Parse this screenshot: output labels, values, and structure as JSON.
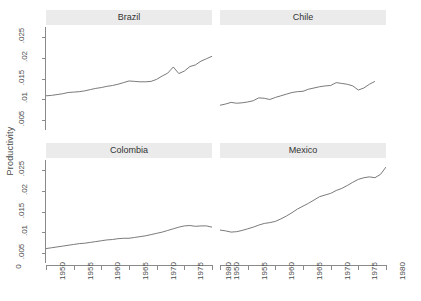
{
  "chart_data": {
    "type": "line",
    "title": "",
    "xlabel": "",
    "ylabel": "Productivity",
    "xlim": [
      1950,
      1980
    ],
    "ylim": [
      0.0025,
      0.0275
    ],
    "grid": false,
    "legend": "none",
    "layout": "2x2 trellis panels, shared axes",
    "yticks": [
      0.005,
      0.01,
      0.015,
      0.02,
      0.025
    ],
    "ytick_labels": [
      ".005",
      ".01",
      ".015",
      ".02",
      ".025"
    ],
    "xticks": [
      1950,
      1955,
      1960,
      1965,
      1970,
      1975,
      1980
    ],
    "xtick_labels": [
      "1950",
      "1955",
      "1960",
      "1965",
      "1970",
      "1975",
      "1980"
    ],
    "zero_tick_label": "0",
    "line_color": "#6b6b6b",
    "strip_color": "#ebebeb",
    "panels": [
      {
        "name": "Brazil",
        "row": 0,
        "col": 0,
        "x": [
          1950,
          1951,
          1952,
          1953,
          1954,
          1955,
          1956,
          1957,
          1958,
          1959,
          1960,
          1961,
          1962,
          1963,
          1964,
          1965,
          1966,
          1967,
          1968,
          1969,
          1970,
          1971,
          1972,
          1973,
          1974,
          1975,
          1976,
          1977,
          1978,
          1979,
          1980
        ],
        "y": [
          0.0108,
          0.0109,
          0.0111,
          0.0113,
          0.0116,
          0.0117,
          0.0118,
          0.012,
          0.0123,
          0.0126,
          0.0128,
          0.0131,
          0.0133,
          0.0136,
          0.014,
          0.0144,
          0.0143,
          0.0142,
          0.0142,
          0.0143,
          0.0148,
          0.0156,
          0.0163,
          0.0178,
          0.0162,
          0.0168,
          0.0179,
          0.0183,
          0.0192,
          0.0198,
          0.0204
        ]
      },
      {
        "name": "Chile",
        "row": 0,
        "col": 1,
        "x": [
          1950,
          1951,
          1952,
          1953,
          1954,
          1955,
          1956,
          1957,
          1958,
          1959,
          1960,
          1961,
          1962,
          1963,
          1964,
          1965,
          1966,
          1967,
          1968,
          1969,
          1970,
          1971,
          1972,
          1973,
          1974,
          1975,
          1976,
          1977,
          1978
        ],
        "y": [
          0.0085,
          0.0088,
          0.0092,
          0.009,
          0.0091,
          0.0093,
          0.0096,
          0.0103,
          0.0102,
          0.0099,
          0.0104,
          0.0108,
          0.0112,
          0.0116,
          0.0118,
          0.0119,
          0.0124,
          0.0127,
          0.013,
          0.0132,
          0.0133,
          0.014,
          0.0138,
          0.0136,
          0.0132,
          0.0122,
          0.0127,
          0.0136,
          0.0143
        ]
      },
      {
        "name": "Colombia",
        "row": 1,
        "col": 0,
        "x": [
          1950,
          1951,
          1952,
          1953,
          1954,
          1955,
          1956,
          1957,
          1958,
          1959,
          1960,
          1961,
          1962,
          1963,
          1964,
          1965,
          1966,
          1967,
          1968,
          1969,
          1970,
          1971,
          1972,
          1973,
          1974,
          1975,
          1976,
          1977,
          1978,
          1979,
          1980
        ],
        "y": [
          0.006,
          0.0062,
          0.0064,
          0.0066,
          0.0068,
          0.007,
          0.0072,
          0.0073,
          0.0075,
          0.0077,
          0.0079,
          0.0081,
          0.0082,
          0.0084,
          0.0085,
          0.0085,
          0.0087,
          0.0089,
          0.0091,
          0.0094,
          0.0097,
          0.01,
          0.0104,
          0.0108,
          0.0112,
          0.0115,
          0.0116,
          0.0114,
          0.0115,
          0.0115,
          0.0112
        ]
      },
      {
        "name": "Mexico",
        "row": 1,
        "col": 1,
        "x": [
          1950,
          1951,
          1952,
          1953,
          1954,
          1955,
          1956,
          1957,
          1958,
          1959,
          1960,
          1961,
          1962,
          1963,
          1964,
          1965,
          1966,
          1967,
          1968,
          1969,
          1970,
          1971,
          1972,
          1973,
          1974,
          1975,
          1976,
          1977,
          1978,
          1979,
          1980
        ],
        "y": [
          0.0105,
          0.0103,
          0.01,
          0.0101,
          0.0104,
          0.0108,
          0.0112,
          0.0117,
          0.0121,
          0.0123,
          0.0126,
          0.0132,
          0.0139,
          0.0147,
          0.0156,
          0.0163,
          0.017,
          0.0178,
          0.0186,
          0.019,
          0.0194,
          0.0201,
          0.0206,
          0.0213,
          0.0221,
          0.0228,
          0.0232,
          0.0234,
          0.0232,
          0.024,
          0.0258
        ]
      }
    ]
  }
}
